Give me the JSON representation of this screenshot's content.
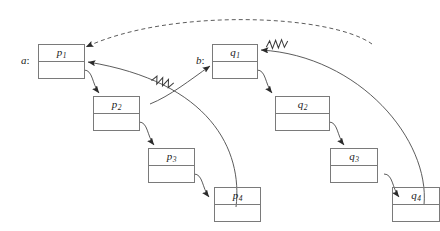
{
  "diagram": {
    "stroke_color": "#7a7a7a",
    "arrow_color": "#2b2b2b",
    "background": "#ffffff",
    "variables": [
      {
        "id": "a",
        "label": "a",
        "colon": ":",
        "points_to": "p1"
      },
      {
        "id": "b",
        "label": "b",
        "colon": ":",
        "points_to": "q1"
      }
    ],
    "lists": [
      {
        "name": "a",
        "nodes": [
          {
            "id": "p1",
            "label": "p",
            "index": "1"
          },
          {
            "id": "p2",
            "label": "p",
            "index": "2"
          },
          {
            "id": "p3",
            "label": "p",
            "index": "3"
          },
          {
            "id": "p4",
            "label": "p",
            "index": "4"
          }
        ]
      },
      {
        "name": "b",
        "nodes": [
          {
            "id": "q1",
            "label": "q",
            "index": "1"
          },
          {
            "id": "q2",
            "label": "q",
            "index": "2"
          },
          {
            "id": "q3",
            "label": "q",
            "index": "3"
          },
          {
            "id": "q4",
            "label": "q",
            "index": "4"
          }
        ]
      }
    ],
    "edges": [
      {
        "id": "p1-p2",
        "from": "p1",
        "to": "p2",
        "style": "solid",
        "marker": "arrow"
      },
      {
        "id": "p2-p3",
        "from": "p2",
        "to": "p3",
        "style": "solid",
        "marker": "arrow"
      },
      {
        "id": "p3-p4",
        "from": "p3",
        "to": "p4",
        "style": "solid",
        "marker": "arrow"
      },
      {
        "id": "q1-q2",
        "from": "q1",
        "to": "q2",
        "style": "solid",
        "marker": "arrow"
      },
      {
        "id": "q2-q3",
        "from": "q2",
        "to": "q3",
        "style": "solid",
        "marker": "arrow"
      },
      {
        "id": "q3-q4",
        "from": "q3",
        "to": "q4",
        "style": "solid",
        "marker": "arrow"
      },
      {
        "id": "p4-p1",
        "from": "p4",
        "to": "p1",
        "style": "solid",
        "marker": "arrow",
        "break_mark": "zigzag"
      },
      {
        "id": "q4-q1",
        "from": "q4",
        "to": "q1",
        "style": "solid",
        "marker": "arrow",
        "break_mark": "zigzag"
      },
      {
        "id": "q4-p1",
        "from": "q4",
        "to": "p1",
        "style": "dashed",
        "marker": "arrow"
      },
      {
        "id": "p4-b",
        "from": "p4",
        "to": "b",
        "style": "solid",
        "marker": "arrow"
      }
    ]
  }
}
